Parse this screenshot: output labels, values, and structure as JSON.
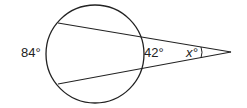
{
  "figure": {
    "type": "circle-with-two-secants",
    "labels": {
      "far_arc": "84°",
      "near_arc": "42°",
      "angle": "x°"
    },
    "colors": {
      "stroke": "#222222",
      "background": "#ffffff"
    }
  }
}
